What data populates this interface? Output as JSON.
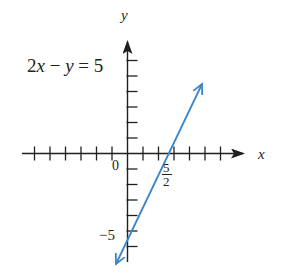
{
  "chart_data": {
    "type": "line",
    "title": "",
    "equation": "2x − y = 5",
    "xlabel": "x",
    "ylabel": "y",
    "xlim": [
      -6,
      6
    ],
    "ylim": [
      -6,
      6
    ],
    "x_ticks": [
      -6,
      -5,
      -4,
      -3,
      -2,
      -1,
      1,
      2,
      3,
      4,
      5,
      6
    ],
    "y_ticks": [
      -6,
      -5,
      -4,
      -3,
      -2,
      -1,
      1,
      2,
      3,
      4,
      5,
      6
    ],
    "tick_labels": {
      "origin": "0",
      "x_intercept": {
        "value": 2.5,
        "numerator": "5",
        "denominator": "2"
      },
      "y_intercept": {
        "value": -5,
        "label": "−5"
      }
    },
    "grid": false,
    "legend": null,
    "series": [
      {
        "name": "2x − y = 5",
        "equation": "y = 2x − 5",
        "slope": 2,
        "intercept": -5,
        "x": [
          -0.75,
          0,
          2.5,
          4.8
        ],
        "y": [
          -6.5,
          -5,
          0,
          4.6
        ],
        "color": "#3a86c8",
        "arrows": "both"
      }
    ]
  },
  "labels": {
    "equation": "2x − y = 5",
    "x_axis": "x",
    "y_axis": "y",
    "origin": "0",
    "x_intercept_num": "5",
    "x_intercept_den": "2",
    "y_intercept": "−5"
  },
  "colors": {
    "line": "#3a86c8",
    "axis": "#231f20",
    "text": "#231f20"
  }
}
